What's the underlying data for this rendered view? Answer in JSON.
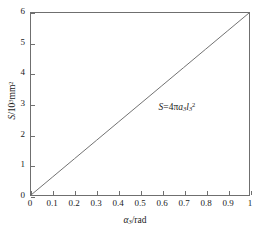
{
  "chart_data": {
    "type": "line",
    "title": "",
    "subtitle": "",
    "xlabel": "α₃/rad",
    "ylabel": "S/10³mm²",
    "xlabel_parts": {
      "symbol": "α",
      "sub": "3",
      "unit": "/rad"
    },
    "ylabel_parts": {
      "symbol": "S",
      "slash": "/10",
      "exp": "3",
      "unit": "mm",
      "unit_exp": "2"
    },
    "xlim": [
      0,
      1
    ],
    "ylim": [
      0,
      6
    ],
    "xticks": [
      "0",
      "0.1",
      "0.2",
      "0.3",
      "0.4",
      "0.5",
      "0.6",
      "0.7",
      "0.8",
      "0.9",
      "1"
    ],
    "xtick_values": [
      0,
      0.1,
      0.2,
      0.3,
      0.4,
      0.5,
      0.6,
      0.7,
      0.8,
      0.9,
      1
    ],
    "yticks": [
      "0",
      "1",
      "2",
      "3",
      "4",
      "5",
      "6"
    ],
    "ytick_values": [
      0,
      1,
      2,
      3,
      4,
      5,
      6
    ],
    "grid": false,
    "legend": null,
    "tick_direction": "in",
    "frame": "full-box",
    "line_color": "#707070",
    "line_width": 1,
    "series": [
      {
        "name": "S=4πa₃l₃²",
        "x": [
          0,
          0.1,
          0.2,
          0.3,
          0.4,
          0.5,
          0.6,
          0.7,
          0.8,
          0.9,
          1
        ],
        "values": [
          0,
          0.6,
          1.2,
          1.8,
          2.4,
          3.0,
          3.6,
          4.2,
          4.8,
          5.4,
          6.0
        ]
      }
    ],
    "annotations": [
      {
        "text": "S=4πa₃l₃²",
        "parts": {
          "lhs": "S",
          "eq": "=4",
          "pi": "π",
          "a": "a",
          "a_sub": "3",
          "l": "l",
          "l_sub": "3",
          "l_sup": "2"
        },
        "x": 0.58,
        "y": 2.95
      }
    ]
  }
}
